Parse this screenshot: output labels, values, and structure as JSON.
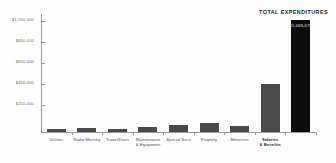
{
  "chart_data": {
    "type": "bar",
    "title": "",
    "annotation": "TOTAL EXPENDITURES",
    "xlabel": "",
    "ylabel": "",
    "grid": false,
    "legend": null,
    "ylim": [
      0,
      1125000
    ],
    "ytick_labels": [
      "$250,000",
      "$450,000",
      "$650,000",
      "$850,000",
      "$1,050,000"
    ],
    "ytick_values": [
      250000,
      450000,
      650000,
      850000,
      1050000
    ],
    "categories": [
      "Utilities",
      "Radio Ministry",
      "Travel/Dues",
      "Maintenance & Equipment",
      "Special Svcs",
      "Property",
      "Ministries",
      "Salaries & Benefits",
      "Total"
    ],
    "values": [
      28000,
      40000,
      30000,
      52000,
      68000,
      82000,
      62000,
      455000,
      1065000
    ],
    "bar_labels": [
      "",
      "",
      "",
      "",
      "",
      "",
      "",
      "",
      "$1,065,070"
    ],
    "colors": {
      "bar": "#4a4a4a",
      "total_bar": "#0b0b0b",
      "axis": "#9a9a9a",
      "tick_text": "#6d6d6d",
      "label_text": "#4a4a4a",
      "annotation_text": "#1f1f1f",
      "background": "#fefefe"
    }
  },
  "categories_display": [
    {
      "line1": "Utilities",
      "line2": ""
    },
    {
      "line1": "Radio Ministry",
      "line2": ""
    },
    {
      "line1": "Travel/Dues",
      "line2": ""
    },
    {
      "line1": "Maintenance",
      "line2": "& Equipment"
    },
    {
      "line1": "Special Svcs",
      "line2": ""
    },
    {
      "line1": "Property",
      "line2": ""
    },
    {
      "line1": "Ministries",
      "line2": ""
    },
    {
      "line1": "Salaries",
      "line2": "& Benefits"
    },
    {
      "line1": "",
      "line2": ""
    }
  ]
}
